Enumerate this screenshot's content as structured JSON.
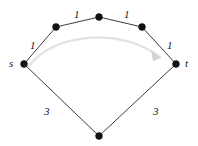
{
  "figure": {
    "width": 198,
    "height": 146,
    "background": "#ffffff"
  },
  "colors": {
    "edge": "#3d3d42",
    "node": "#121214",
    "curve": "#e2e2e4",
    "curve_head": "#d2d2d6",
    "label": "#17171a"
  },
  "graph": {
    "nodes": [
      {
        "id": "s",
        "label": "s",
        "label_side": "left",
        "x": 24,
        "y": 64,
        "r": 3.4
      },
      {
        "id": "u1",
        "label": "",
        "label_side": "none",
        "x": 56,
        "y": 27,
        "r": 3.4
      },
      {
        "id": "u2",
        "label": "",
        "label_side": "none",
        "x": 99,
        "y": 17,
        "r": 3.4
      },
      {
        "id": "u3",
        "label": "",
        "label_side": "none",
        "x": 142,
        "y": 27,
        "r": 3.4
      },
      {
        "id": "t",
        "label": "t",
        "label_side": "right",
        "x": 176,
        "y": 64,
        "r": 3.4
      },
      {
        "id": "b1",
        "label": "",
        "label_side": "none",
        "x": 99,
        "y": 136,
        "r": 3.4
      }
    ],
    "edges": [
      {
        "from": "s",
        "to": "u1",
        "weight": "1",
        "wx": 30,
        "wy": 40
      },
      {
        "from": "u1",
        "to": "u2",
        "weight": "1",
        "wx": 74,
        "wy": 9
      },
      {
        "from": "u2",
        "to": "u3",
        "weight": "1",
        "wx": 124,
        "wy": 9
      },
      {
        "from": "u3",
        "to": "t",
        "weight": "1",
        "wx": 167,
        "wy": 40
      },
      {
        "from": "s",
        "to": "b1",
        "weight": "3",
        "wx": 44,
        "wy": 106
      },
      {
        "from": "b1",
        "to": "t",
        "weight": "3",
        "wx": 153,
        "wy": 106
      }
    ],
    "arrow": {
      "name": "s-to-t-path-arrow",
      "from": "s",
      "to": "t",
      "path": "M 29 66 C 52 34, 120 26, 160 57",
      "head_points": "160,57 152,51 154,60"
    }
  },
  "terminal_labels": {
    "source": {
      "text": "s",
      "x": 9,
      "y": 58
    },
    "target": {
      "text": "t",
      "x": 185,
      "y": 58
    }
  }
}
